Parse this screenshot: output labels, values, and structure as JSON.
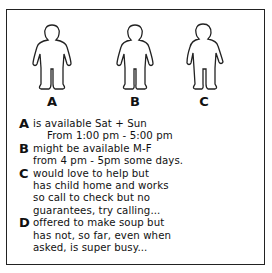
{
  "figures": [
    {
      "label": "A"
    },
    {
      "label": "B"
    },
    {
      "label": "C"
    }
  ],
  "notes": [
    {
      "letter": "A",
      "lines": [
        "is available Sat + Sun",
        "From 1:00 pm - 5:00 pm"
      ]
    },
    {
      "letter": "B",
      "lines": [
        "might be available M-F",
        "from 4 pm - 5pm some days."
      ]
    },
    {
      "letter": "C",
      "lines": [
        "would love to help but",
        "has child home and works",
        "so call to check but no",
        "guarantees, try calling..."
      ]
    },
    {
      "letter": "D",
      "lines": [
        "offered to make soup but",
        "has not, so far, even when",
        "asked, is super busy..."
      ]
    }
  ]
}
